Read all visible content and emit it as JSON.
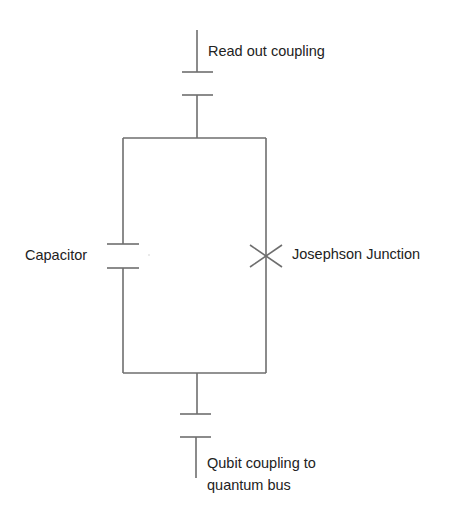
{
  "diagram": {
    "type": "transmon-qubit-circuit",
    "line_color": "#6e6e6e",
    "text_color": "#222222",
    "labels": {
      "readout": "Read out coupling",
      "capacitor": "Capacitor",
      "josephson_junction": "Josephson Junction",
      "qubit_coupling_line1": "Qubit coupling to",
      "qubit_coupling_line2": "quantum bus"
    },
    "components": [
      {
        "name": "readout-coupling-capacitor",
        "position": "top"
      },
      {
        "name": "shunt-capacitor",
        "position": "left branch"
      },
      {
        "name": "josephson-junction",
        "position": "right branch"
      },
      {
        "name": "bus-coupling-capacitor",
        "position": "bottom"
      }
    ]
  }
}
